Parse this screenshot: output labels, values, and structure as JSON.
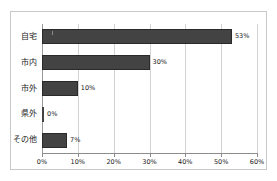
{
  "chart_data": {
    "type": "bar",
    "orientation": "horizontal",
    "title": "",
    "xlabel": "",
    "ylabel": "",
    "categories": [
      "自宅",
      "市内",
      "市外",
      "県外",
      "その他"
    ],
    "values": [
      53,
      30,
      10,
      0,
      7
    ],
    "value_labels": [
      "53%",
      "30%",
      "10%",
      "0%",
      "7%"
    ],
    "xlim": [
      0,
      60
    ],
    "xticks": [
      0,
      10,
      20,
      30,
      40,
      50,
      60
    ],
    "xtick_labels": [
      "0%",
      "10%",
      "20%",
      "30%",
      "40%",
      "50%",
      "60%"
    ],
    "grid": "vertical",
    "legend": "none",
    "bar_color": "#434343",
    "gridline_color": "#d2d2d2",
    "axis_color": "#8c8c8c",
    "border_color": "#c8c8c8",
    "background": "#ffffff"
  }
}
